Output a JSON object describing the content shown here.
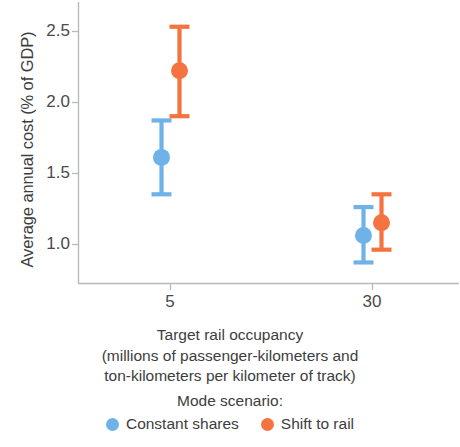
{
  "chart_data": {
    "type": "scatter",
    "title": "",
    "xlabel": "Target rail occupancy\n(millions of passenger-kilometers and\nton-kilometers per kilometer of track)",
    "ylabel": "Average annual cost (% of GDP)",
    "categories": [
      "5",
      "30"
    ],
    "ytick_labels": [
      "1.0",
      "1.5",
      "2.0",
      "2.5"
    ],
    "ytick_values": [
      1.0,
      1.5,
      2.0,
      2.5
    ],
    "ylim": [
      0.75,
      2.62
    ],
    "grid": false,
    "legend_position": "bottom",
    "legend_title": "Mode scenario:",
    "series": [
      {
        "name": "Constant shares",
        "color": "#6FB2E8",
        "values": [
          1.61,
          1.06
        ],
        "ci_low": [
          1.35,
          0.87
        ],
        "ci_high": [
          1.87,
          1.26
        ]
      },
      {
        "name": "Shift to rail",
        "color": "#F4733F",
        "values": [
          2.22,
          1.15
        ],
        "ci_low": [
          1.9,
          0.96
        ],
        "ci_high": [
          2.53,
          1.35
        ]
      }
    ]
  },
  "axis": {
    "x_title_line1": "Target rail occupancy",
    "x_title_line2": "(millions of passenger-kilometers and",
    "x_title_line3": "ton-kilometers per kilometer of track)",
    "y_title": "Average annual cost (% of GDP)",
    "x_tick_1": "5",
    "x_tick_2": "30",
    "y_tick_1": "1.0",
    "y_tick_2": "1.5",
    "y_tick_3": "2.0",
    "y_tick_4": "2.5"
  },
  "legend": {
    "title": "Mode scenario:",
    "item1_label": "Constant shares",
    "item2_label": "Shift to rail",
    "item1_color": "#6FB2E8",
    "item2_color": "#F4733F"
  }
}
